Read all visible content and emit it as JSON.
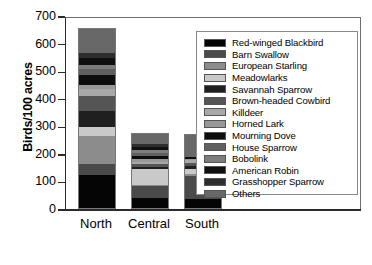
{
  "chart_data": {
    "type": "bar",
    "subtype": "stacked-vertical",
    "title": "",
    "xlabel": "",
    "ylabel": "Birds/100 acres",
    "categories": [
      "North",
      "Central",
      "South"
    ],
    "ylim": [
      0,
      700
    ],
    "yticks": [
      0,
      100,
      200,
      300,
      400,
      500,
      600,
      700
    ],
    "ytick_labels": [
      "0",
      "100",
      "200",
      "300",
      "400",
      "500",
      "600",
      "700"
    ],
    "grid": false,
    "legend_position": "right-inside",
    "totals": [
      650,
      257,
      265
    ],
    "series": [
      {
        "name": "Red-winged Blackbird",
        "color": "#050505",
        "values": [
          118,
          38,
          33
        ]
      },
      {
        "name": "Barn Swallow",
        "color": "#4a4a4a",
        "values": [
          40,
          42,
          82
        ]
      },
      {
        "name": "European Starling",
        "color": "#8c8c8c",
        "values": [
          105,
          5,
          8
        ]
      },
      {
        "name": "Meadowlarks",
        "color": "#c9c9c9",
        "values": [
          30,
          55,
          20
        ]
      },
      {
        "name": "Savannah Sparrow",
        "color": "#1f1f1f",
        "values": [
          60,
          8,
          10
        ]
      },
      {
        "name": "Brown-headed Cowbird",
        "color": "#555555",
        "values": [
          55,
          10,
          12
        ]
      },
      {
        "name": "Killdeer",
        "color": "#a8a8a8",
        "values": [
          25,
          8,
          8
        ]
      },
      {
        "name": "Horned Lark",
        "color": "#989898",
        "values": [
          15,
          12,
          5
        ]
      },
      {
        "name": "Mourning Dove",
        "color": "#0d0d0d",
        "values": [
          35,
          10,
          8
        ]
      },
      {
        "name": "House Sparrow",
        "color": "#606060",
        "values": [
          20,
          12,
          0
        ]
      },
      {
        "name": "Bobolink",
        "color": "#7d7d7d",
        "values": [
          15,
          12,
          0
        ]
      },
      {
        "name": "American Robin",
        "color": "#101010",
        "values": [
          25,
          10,
          0
        ]
      },
      {
        "name": "Grasshopper Sparrow",
        "color": "#2e2e2e",
        "values": [
          20,
          12,
          0
        ]
      },
      {
        "name": "Others",
        "color": "#686868",
        "values": [
          85,
          33,
          79
        ]
      }
    ]
  },
  "axes": {
    "y_title": "Birds/100 acres"
  }
}
